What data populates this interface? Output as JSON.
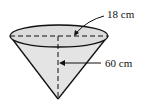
{
  "diagram": {
    "shape": "cone",
    "labels": {
      "radius": "18 cm",
      "height": "60 cm"
    },
    "colors": {
      "fill": "#e4e4e4",
      "stroke": "#111111"
    }
  }
}
